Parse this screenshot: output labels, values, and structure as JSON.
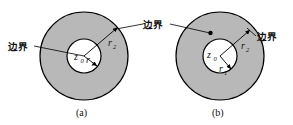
{
  "figure": {
    "type": "geometry-diagram",
    "background_color": "#ffffff",
    "annulus_fill_color": "#b8b8b8",
    "inner_disk_fill_color": "#ffffff",
    "stroke_color": "#000000",
    "panels": [
      {
        "id": "panel-a",
        "caption": "(a)",
        "center": {
          "cx": 84,
          "cy": 56
        },
        "outer_radius": 44,
        "inner_radius": 17,
        "center_point_label": "z",
        "center_point_subscript": "0",
        "inner_radius_label": "r",
        "inner_radius_subscript": "1",
        "outer_radius_label": "r",
        "outer_radius_subscript": "2",
        "boundary_labels": [
          {
            "id": "boundary-left-a",
            "text": "边界",
            "x": 8,
            "y": 49
          },
          {
            "id": "boundary-right-a",
            "text": "边界",
            "x": 146,
            "y": 28
          }
        ]
      },
      {
        "id": "panel-b",
        "caption": "(b)",
        "center": {
          "cx": 220,
          "cy": 56
        },
        "outer_radius": 44,
        "inner_radius": 17,
        "center_point_label": "z",
        "center_point_subscript": "0",
        "inner_radius_label": "r",
        "inner_radius_subscript": "1",
        "outer_radius_label": "r",
        "outer_radius_subscript": "2",
        "boundary_labels": [
          {
            "id": "boundary-left-b",
            "text": "边界",
            "x": 146,
            "y": 28
          },
          {
            "id": "boundary-right-b",
            "text": "边界",
            "x": 258,
            "y": 40
          }
        ]
      }
    ]
  },
  "labels": {
    "boundary_left_a": "边界",
    "boundary_middle": "边界",
    "boundary_right_b": "边界",
    "caption_a": "(a)",
    "caption_b": "(b)",
    "z_a": "z",
    "z_a_sub": "0",
    "r1_a": "r",
    "r1_a_sub": "1",
    "r2_a": "r",
    "r2_a_sub": "2",
    "z_b": "z",
    "z_b_sub": "0",
    "r1_b": "r",
    "r1_b_sub": "1",
    "r2_b": "r",
    "r2_b_sub": "2"
  }
}
